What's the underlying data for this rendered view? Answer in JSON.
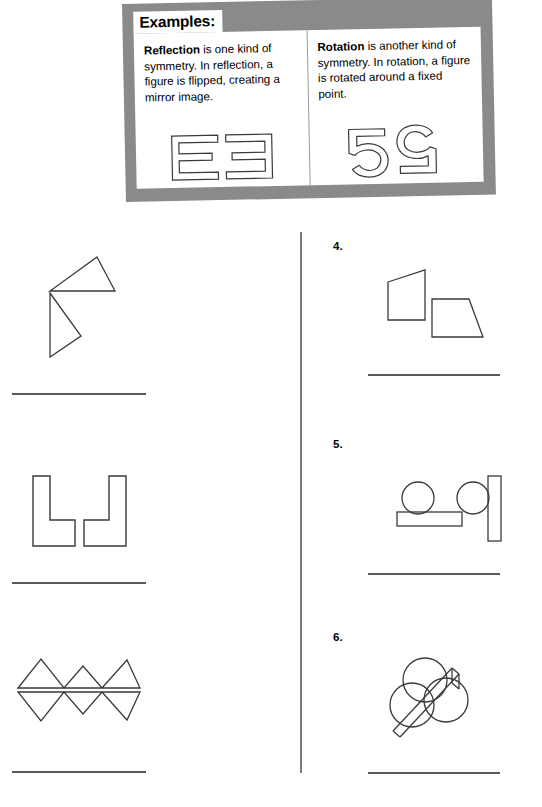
{
  "banner": {
    "title": "Examples:",
    "panels": [
      {
        "term": "Reflection",
        "text": " is one kind of symmetry. In reflection, a figure is flipped, creating a mirror image.",
        "glyph_name": "letter-e-and-mirrored-e"
      },
      {
        "term": "Rotation",
        "text": " is another kind of symmetry. In rotation, a figure is rotated around a fixed point.",
        "glyph_name": "digit-5-and-rotated-5"
      }
    ],
    "background_color": "#8a8a8a",
    "panel_color": "#ffffff"
  },
  "worksheet": {
    "left_column": [
      {
        "number": "",
        "figure_name": "two-triangles-flip"
      },
      {
        "number": "",
        "figure_name": "two-l-shapes-mirror"
      },
      {
        "number": "",
        "figure_name": "zigzag-pair-mirror"
      }
    ],
    "right_column": [
      {
        "number": "4.",
        "figure_name": "two-quadrilaterals"
      },
      {
        "number": "5.",
        "figure_name": "circle-with-bar-pair"
      },
      {
        "number": "6.",
        "figure_name": "two-circles-with-diagonal-band"
      }
    ],
    "line_color": "#5a5a5a",
    "stroke_color": "#3a3a3a"
  }
}
